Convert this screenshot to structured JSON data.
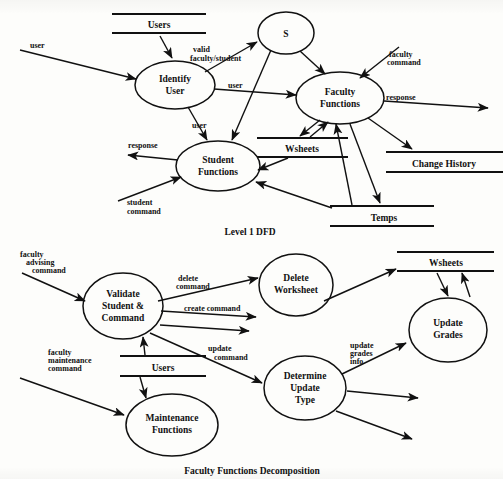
{
  "document": {
    "type": "scanned-figure-page",
    "figures": [
      {
        "caption": "Level 1 DFD",
        "processes": [
          {
            "id": "identify-user",
            "label_line1": "Identify",
            "label_line2": "User"
          },
          {
            "id": "faculty-functions",
            "label_line1": "Faculty",
            "label_line2": "Functions"
          },
          {
            "id": "student-functions",
            "label_line1": "Student",
            "label_line2": "Functions"
          },
          {
            "id": "s-bubble",
            "label_line1": "S",
            "label_line2": ""
          }
        ],
        "data_stores": [
          {
            "id": "users",
            "label": "Users"
          },
          {
            "id": "wsheets",
            "label": "Wsheets"
          },
          {
            "id": "change-history",
            "label": "Change History"
          },
          {
            "id": "temps",
            "label": "Temps"
          }
        ],
        "flows": [
          {
            "id": "user-in",
            "label": "user"
          },
          {
            "id": "valid-faculty-student",
            "label_line1": "valid",
            "label_line2": "faculty/student"
          },
          {
            "id": "user-to-faculty",
            "label": "user"
          },
          {
            "id": "user-to-student",
            "label": "user"
          },
          {
            "id": "faculty-command",
            "label_line1": "faculty",
            "label_line2": "command"
          },
          {
            "id": "response-out-faculty",
            "label": "response"
          },
          {
            "id": "response-out-student",
            "label": "response"
          },
          {
            "id": "student-command",
            "label_line1": "student",
            "label_line2": "command"
          }
        ]
      },
      {
        "caption": "Faculty Functions Decomposition",
        "processes": [
          {
            "id": "validate-student-command",
            "label_line1": "Validate",
            "label_line2": "Student &",
            "label_line3": "Command"
          },
          {
            "id": "delete-worksheet",
            "label_line1": "Delete",
            "label_line2": "Worksheet",
            "label_line3": ""
          },
          {
            "id": "determine-update-type",
            "label_line1": "Determine",
            "label_line2": "Update",
            "label_line3": "Type"
          },
          {
            "id": "update-grades",
            "label_line1": "Update",
            "label_line2": "Grades",
            "label_line3": ""
          },
          {
            "id": "maintenance-functions",
            "label_line1": "Maintenance",
            "label_line2": "Functions",
            "label_line3": ""
          }
        ],
        "data_stores": [
          {
            "id": "users",
            "label": "Users"
          },
          {
            "id": "wsheets",
            "label": "Wsheets"
          }
        ],
        "flows": [
          {
            "id": "faculty-advising-command",
            "label_line1": "faculty",
            "label_line2": "advising",
            "label_line3": "command"
          },
          {
            "id": "faculty-maintenance-command",
            "label_line1": "faculty",
            "label_line2": "maintenance",
            "label_line3": "command"
          },
          {
            "id": "delete-command",
            "label_line1": "delete",
            "label_line2": "command",
            "label_line3": ""
          },
          {
            "id": "create-command",
            "label_line1": "create command",
            "label_line2": "",
            "label_line3": ""
          },
          {
            "id": "update-command",
            "label_line1": "update",
            "label_line2": "command",
            "label_line3": ""
          },
          {
            "id": "update-grades-info",
            "label_line1": "update",
            "label_line2": "grades",
            "label_line3": "info"
          }
        ]
      }
    ]
  },
  "colors": {
    "ink": "#111111",
    "paper": "#fdfdfb"
  }
}
